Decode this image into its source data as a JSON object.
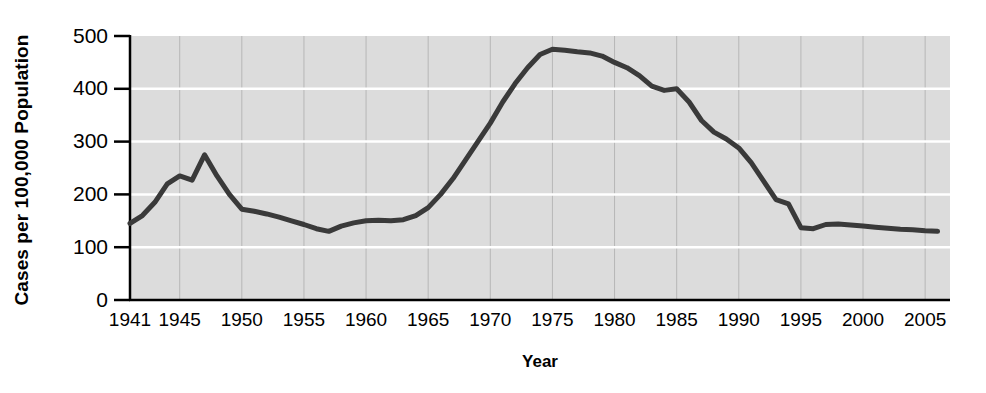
{
  "chart_data": {
    "type": "line",
    "title": "",
    "subtitle": "",
    "xlabel": "Year",
    "ylabel": "Cases per 100,000 Population",
    "xlim": [
      1941,
      2007
    ],
    "ylim": [
      0,
      500
    ],
    "grid": true,
    "legend": null,
    "legend_position": "none",
    "plot_bgcolor": "#dcdcdc",
    "line_color": "#3a3a3a",
    "line_width": 5,
    "axis_color": "#000000",
    "gridline_color_major_y": "#ffffff",
    "gridline_color_major_x": "#9a9a9a",
    "y_ticks": [
      0,
      100,
      200,
      300,
      400,
      500
    ],
    "y_tick_labels": [
      "0",
      "100",
      "200",
      "300",
      "400",
      "500"
    ],
    "x_ticks": [
      1941,
      1945,
      1950,
      1955,
      1960,
      1965,
      1970,
      1975,
      1980,
      1985,
      1990,
      1995,
      2000,
      2005
    ],
    "x_tick_labels": [
      "1941",
      "1945",
      "1950",
      "1955",
      "1960",
      "1965",
      "1970",
      "1975",
      "1980",
      "1985",
      "1990",
      "1995",
      "2000",
      "2005"
    ],
    "series": [
      {
        "name": "Cases per 100,000 Population",
        "x": [
          1941,
          1942,
          1943,
          1944,
          1945,
          1946,
          1947,
          1948,
          1949,
          1950,
          1951,
          1952,
          1953,
          1954,
          1955,
          1956,
          1957,
          1958,
          1959,
          1960,
          1961,
          1962,
          1963,
          1964,
          1965,
          1966,
          1967,
          1968,
          1969,
          1970,
          1971,
          1972,
          1973,
          1974,
          1975,
          1976,
          1977,
          1978,
          1979,
          1980,
          1981,
          1982,
          1983,
          1984,
          1985,
          1986,
          1987,
          1988,
          1989,
          1990,
          1991,
          1992,
          1993,
          1994,
          1995,
          1996,
          1997,
          1998,
          1999,
          2000,
          2001,
          2002,
          2003,
          2004,
          2005,
          2006
        ],
        "y": [
          145,
          160,
          185,
          220,
          235,
          227,
          275,
          235,
          200,
          172,
          168,
          163,
          157,
          150,
          143,
          135,
          130,
          140,
          146,
          150,
          151,
          150,
          152,
          160,
          175,
          200,
          230,
          265,
          300,
          335,
          375,
          410,
          440,
          465,
          475,
          473,
          470,
          468,
          462,
          450,
          440,
          425,
          405,
          397,
          400,
          375,
          340,
          318,
          305,
          288,
          260,
          225,
          190,
          182,
          137,
          135,
          143,
          144,
          142,
          140,
          138,
          136,
          134,
          133,
          131,
          130
        ]
      }
    ],
    "annotations": [
      {
        "label": "post-war peak",
        "x": 1947,
        "y": 275
      },
      {
        "label": "epidemic peak",
        "x": 1975,
        "y": 475
      },
      {
        "label": "minimum",
        "x": 1957,
        "y": 130
      }
    ]
  }
}
